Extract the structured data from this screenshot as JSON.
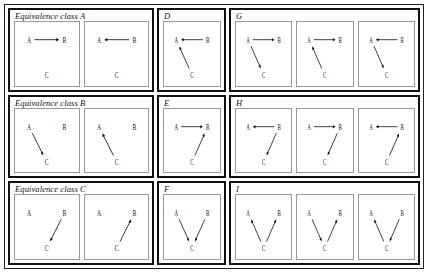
{
  "figure": {
    "title": "",
    "node_labels": {
      "a": "A",
      "b": "B",
      "c": "C"
    },
    "groups": [
      {
        "id": "class-a",
        "label": "Equivalence class A",
        "kind": "class",
        "cells": [
          {
            "id": "class-a-1",
            "edges": [
              {
                "from": "A",
                "to": "B"
              }
            ]
          },
          {
            "id": "class-a-2",
            "edges": [
              {
                "from": "B",
                "to": "A"
              }
            ]
          }
        ]
      },
      {
        "id": "d",
        "label": "D",
        "kind": "single",
        "cells": [
          {
            "id": "d-1",
            "edges": [
              {
                "from": "B",
                "to": "A"
              },
              {
                "from": "C",
                "to": "A"
              }
            ]
          }
        ]
      },
      {
        "id": "g",
        "label": "G",
        "kind": "triple",
        "cells": [
          {
            "id": "g-1",
            "edges": [
              {
                "from": "A",
                "to": "B"
              },
              {
                "from": "A",
                "to": "C"
              }
            ]
          },
          {
            "id": "g-2",
            "edges": [
              {
                "from": "A",
                "to": "B"
              },
              {
                "from": "C",
                "to": "A"
              }
            ]
          },
          {
            "id": "g-3",
            "edges": [
              {
                "from": "B",
                "to": "A"
              },
              {
                "from": "A",
                "to": "C"
              }
            ]
          }
        ]
      },
      {
        "id": "class-b",
        "label": "Equivalence class B",
        "kind": "class",
        "cells": [
          {
            "id": "class-b-1",
            "edges": [
              {
                "from": "A",
                "to": "C"
              }
            ]
          },
          {
            "id": "class-b-2",
            "edges": [
              {
                "from": "C",
                "to": "A"
              }
            ]
          }
        ]
      },
      {
        "id": "e",
        "label": "E",
        "kind": "single",
        "cells": [
          {
            "id": "e-1",
            "edges": [
              {
                "from": "A",
                "to": "B"
              },
              {
                "from": "C",
                "to": "B"
              }
            ]
          }
        ]
      },
      {
        "id": "h",
        "label": "H",
        "kind": "triple",
        "cells": [
          {
            "id": "h-1",
            "edges": [
              {
                "from": "B",
                "to": "A"
              },
              {
                "from": "B",
                "to": "C"
              }
            ]
          },
          {
            "id": "h-2",
            "edges": [
              {
                "from": "A",
                "to": "B"
              },
              {
                "from": "B",
                "to": "C"
              }
            ]
          },
          {
            "id": "h-3",
            "edges": [
              {
                "from": "B",
                "to": "A"
              },
              {
                "from": "C",
                "to": "B"
              }
            ]
          }
        ]
      },
      {
        "id": "class-c",
        "label": "Equivalence class C",
        "kind": "class",
        "cells": [
          {
            "id": "class-c-1",
            "edges": [
              {
                "from": "B",
                "to": "C"
              }
            ]
          },
          {
            "id": "class-c-2",
            "edges": [
              {
                "from": "C",
                "to": "B"
              }
            ]
          }
        ]
      },
      {
        "id": "f",
        "label": "F",
        "kind": "single",
        "cells": [
          {
            "id": "f-1",
            "edges": [
              {
                "from": "A",
                "to": "C"
              },
              {
                "from": "B",
                "to": "C"
              }
            ]
          }
        ]
      },
      {
        "id": "i",
        "label": "I",
        "kind": "triple",
        "cells": [
          {
            "id": "i-1",
            "edges": [
              {
                "from": "C",
                "to": "A"
              },
              {
                "from": "C",
                "to": "B"
              }
            ]
          },
          {
            "id": "i-2",
            "edges": [
              {
                "from": "A",
                "to": "C"
              },
              {
                "from": "C",
                "to": "B"
              }
            ]
          },
          {
            "id": "i-3",
            "edges": [
              {
                "from": "C",
                "to": "A"
              },
              {
                "from": "B",
                "to": "C"
              }
            ]
          }
        ]
      }
    ],
    "rows": [
      [
        "class-a",
        "d",
        "g"
      ],
      [
        "class-b",
        "e",
        "h"
      ],
      [
        "class-c",
        "f",
        "i"
      ]
    ],
    "colors": {
      "outer_border": "#222222",
      "group_border": "#111111",
      "cell_border": "#999999",
      "ink": "#111111",
      "background": "#ffffff"
    }
  }
}
